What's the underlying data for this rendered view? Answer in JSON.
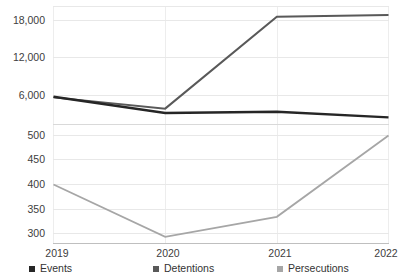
{
  "chart_data": {
    "type": "line",
    "title": "",
    "subtitle": "",
    "xlabel": "",
    "ylabel": "",
    "broken_axis": true,
    "grid": true,
    "legend_position": "bottom",
    "categories": [
      "2019",
      "2020",
      "2021",
      "2022"
    ],
    "series": [
      {
        "name": "Events",
        "color": "#262626",
        "panel": "upper",
        "values": [
          5800,
          3200,
          3400,
          2500
        ]
      },
      {
        "name": "Detentions",
        "color": "#595959",
        "panel": "upper",
        "values": [
          5700,
          3900,
          18600,
          18900
        ]
      },
      {
        "name": "Persecutions",
        "color": "#a6a6a6",
        "panel": "lower",
        "values": [
          400,
          293,
          334,
          500
        ]
      }
    ],
    "upper_panel": {
      "ticks": [
        6000,
        12000,
        18000
      ],
      "tick_labels": [
        "6,000",
        "12,000",
        "18,000"
      ],
      "ylim": [
        0,
        21000
      ]
    },
    "lower_panel": {
      "ticks": [
        300,
        350,
        400,
        450,
        500
      ],
      "tick_labels": [
        "300",
        "350",
        "400",
        "450",
        "500"
      ],
      "ylim": [
        280,
        515
      ]
    }
  },
  "legend": {
    "items": [
      {
        "label": "Events",
        "color": "#262626"
      },
      {
        "label": "Detentions",
        "color": "#595959"
      },
      {
        "label": "Persecutions",
        "color": "#a6a6a6"
      }
    ]
  },
  "axes": {
    "x_tick_labels": [
      "2019",
      "2020",
      "2021",
      "2022"
    ],
    "upper_y_tick_labels": [
      "18,000",
      "12,000",
      "6,000"
    ],
    "lower_y_tick_labels": [
      "500",
      "450",
      "400",
      "350",
      "300"
    ]
  }
}
